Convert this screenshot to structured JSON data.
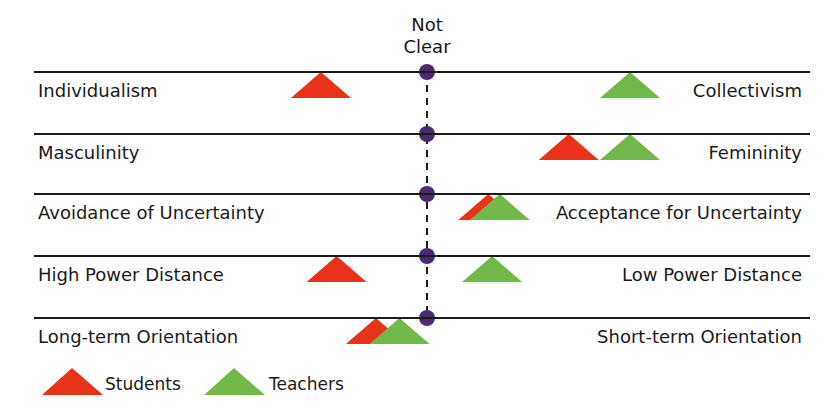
{
  "chart_data": {
    "type": "scatter",
    "title": "",
    "center_label": "Not Clear",
    "scale": {
      "min": -100,
      "max": 100,
      "center": 0,
      "note": "negative = left pole, positive = right pole, 0 = Not Clear"
    },
    "dimensions": [
      {
        "left": "Individualism",
        "right": "Collectivism"
      },
      {
        "left": "Masculinity",
        "right": "Femininity"
      },
      {
        "left": "Avoidance of Uncertainty",
        "right": "Acceptance for Uncertainty"
      },
      {
        "left": "High Power Distance",
        "right": "Low Power Distance"
      },
      {
        "left": "Long-term Orientation",
        "right": "Short-term Orientation"
      }
    ],
    "series": [
      {
        "name": "Students",
        "color": "#e8321a",
        "values": [
          -27,
          37,
          16,
          -23,
          -13
        ]
      },
      {
        "name": "Teachers",
        "color": "#72b84a",
        "values": [
          53,
          53,
          19,
          17,
          -7
        ]
      }
    ],
    "legend": {
      "position": "bottom-left",
      "entries": [
        "Students",
        "Teachers"
      ]
    },
    "grid": false
  },
  "colors": {
    "students": "#e8321a",
    "teachers": "#72b84a",
    "center_marker": "#4a2c6e",
    "line": "#1c1c1c"
  },
  "legend": {
    "students_label": "Students",
    "teachers_label": "Teachers"
  }
}
